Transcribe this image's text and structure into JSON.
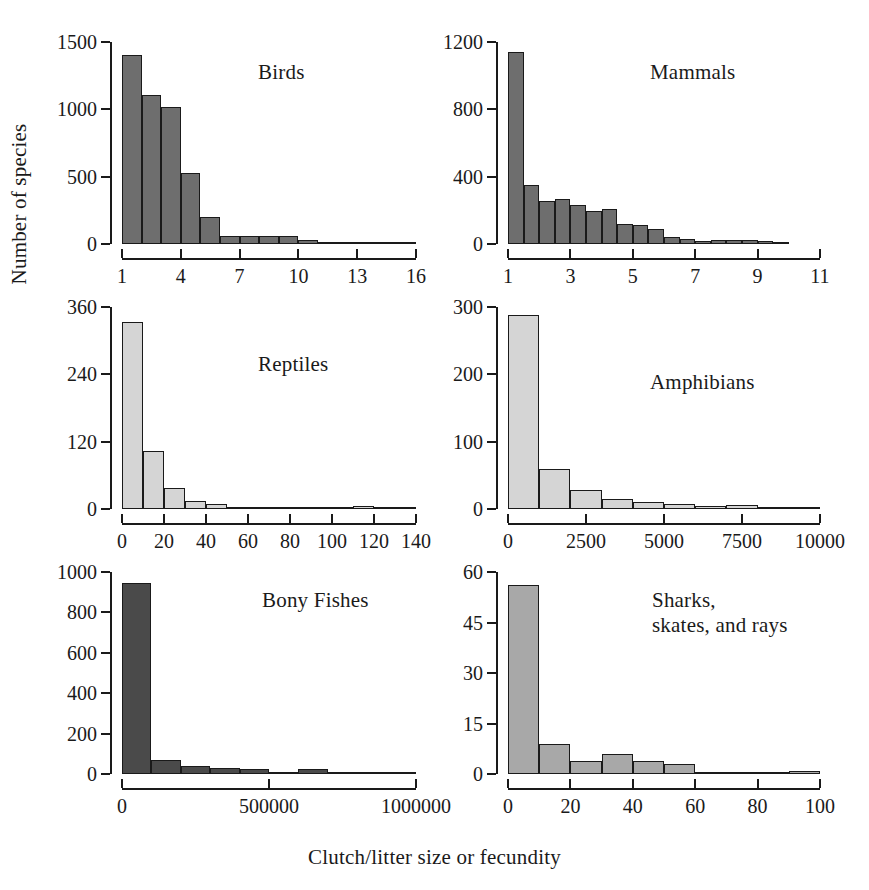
{
  "figure": {
    "xlabel": "Clutch/litter size or fecundity",
    "ylabel": "Number of species"
  },
  "chart_data": [
    {
      "type": "bar",
      "title": "Birds",
      "xlabel": "",
      "ylabel": "Number of species",
      "fill_color": "#6e6e6e",
      "edge_color": "#1a1a1a",
      "grid": false,
      "legend": "none",
      "xlim": [
        1,
        16
      ],
      "ylim": [
        0,
        1500
      ],
      "yticks": [
        0,
        500,
        1000,
        1500
      ],
      "ytick_labels": [
        "0",
        "500",
        "1000",
        "1500"
      ],
      "xticks": [
        1,
        4,
        7,
        10,
        13,
        16
      ],
      "xtick_labels": [
        "1",
        "4",
        "7",
        "10",
        "13",
        "16"
      ],
      "bin_edges": [
        1,
        2,
        3,
        4,
        5,
        6,
        7,
        8,
        9,
        10,
        11,
        12,
        13,
        14,
        15,
        16
      ],
      "values": [
        1400,
        1105,
        1015,
        525,
        200,
        57,
        57,
        62,
        57,
        33,
        12,
        4,
        2,
        1,
        0
      ]
    },
    {
      "type": "bar",
      "title": "Mammals",
      "xlabel": "",
      "ylabel": "Number of species",
      "fill_color": "#6e6e6e",
      "edge_color": "#1a1a1a",
      "grid": false,
      "legend": "none",
      "xlim": [
        1,
        11
      ],
      "ylim": [
        0,
        1200
      ],
      "yticks": [
        0,
        400,
        800,
        1200
      ],
      "ytick_labels": [
        "0",
        "400",
        "800",
        "1200"
      ],
      "xticks": [
        1,
        3,
        5,
        7,
        9,
        11
      ],
      "xtick_labels": [
        "1",
        "3",
        "5",
        "7",
        "9",
        "11"
      ],
      "bin_edges": [
        1,
        1.5,
        2,
        2.5,
        3,
        3.5,
        4,
        4.5,
        5,
        5.5,
        6,
        6.5,
        7,
        7.5,
        8,
        8.5,
        9,
        9.5,
        10
      ],
      "values": [
        1140,
        348,
        255,
        270,
        232,
        195,
        208,
        120,
        113,
        92,
        44,
        30,
        18,
        25,
        22,
        22,
        20,
        4
      ]
    },
    {
      "type": "bar",
      "title": "Reptiles",
      "xlabel": "",
      "ylabel": "Number of species",
      "fill_color": "#d5d5d5",
      "edge_color": "#1a1a1a",
      "grid": false,
      "legend": "none",
      "xlim": [
        0,
        140
      ],
      "ylim": [
        0,
        360
      ],
      "yticks": [
        0,
        120,
        240,
        360
      ],
      "ytick_labels": [
        "0",
        "120",
        "240",
        "360"
      ],
      "xticks": [
        0,
        20,
        40,
        60,
        80,
        100,
        120,
        140
      ],
      "xtick_labels": [
        "0",
        "20",
        "40",
        "60",
        "80",
        "100",
        "120",
        "140"
      ],
      "bin_edges": [
        0,
        10,
        20,
        30,
        40,
        50,
        60,
        70,
        80,
        90,
        100,
        110,
        120,
        130,
        140
      ],
      "values": [
        333,
        103,
        38,
        15,
        9,
        3,
        1,
        1,
        2,
        2,
        1,
        6,
        1,
        1
      ]
    },
    {
      "type": "bar",
      "title": "Amphibians",
      "xlabel": "",
      "ylabel": "Number of species",
      "fill_color": "#d5d5d5",
      "edge_color": "#1a1a1a",
      "grid": false,
      "legend": "none",
      "xlim": [
        0,
        10000
      ],
      "ylim": [
        0,
        300
      ],
      "yticks": [
        0,
        100,
        200,
        300
      ],
      "ytick_labels": [
        "0",
        "100",
        "200",
        "300"
      ],
      "xticks": [
        0,
        2500,
        5000,
        7500,
        10000
      ],
      "xtick_labels": [
        "0",
        "2500",
        "5000",
        "7500",
        "10000"
      ],
      "bin_edges": [
        0,
        1000,
        2000,
        3000,
        4000,
        5000,
        6000,
        7000,
        8000,
        9000,
        10000
      ],
      "values": [
        288,
        60,
        28,
        15,
        11,
        7,
        4,
        6,
        1,
        3
      ]
    },
    {
      "type": "bar",
      "title": "Bony Fishes",
      "xlabel": "",
      "ylabel": "Number of species",
      "fill_color": "#4a4a4a",
      "edge_color": "#1a1a1a",
      "grid": false,
      "legend": "none",
      "xlim": [
        0,
        1000000
      ],
      "ylim": [
        0,
        1000
      ],
      "yticks": [
        0,
        200,
        400,
        600,
        800,
        1000
      ],
      "ytick_labels": [
        "0",
        "200",
        "400",
        "600",
        "800",
        "1000"
      ],
      "xticks": [
        0,
        500000,
        1000000
      ],
      "xtick_labels": [
        "0",
        "500000",
        "1000000"
      ],
      "bin_edges": [
        0,
        100000,
        200000,
        300000,
        400000,
        500000,
        600000,
        700000,
        800000,
        900000,
        1000000
      ],
      "values": [
        948,
        70,
        40,
        28,
        25,
        10,
        25,
        9,
        7,
        6
      ]
    },
    {
      "type": "bar",
      "title": "Sharks,\nskates, and rays",
      "xlabel": "",
      "ylabel": "Number of species",
      "fill_color": "#a8a8a8",
      "edge_color": "#1a1a1a",
      "grid": false,
      "legend": "none",
      "xlim": [
        0,
        100
      ],
      "ylim": [
        0,
        60
      ],
      "yticks": [
        0,
        15,
        30,
        45,
        60
      ],
      "ytick_labels": [
        "0",
        "15",
        "30",
        "45",
        "60"
      ],
      "xticks": [
        0,
        20,
        40,
        60,
        80,
        100
      ],
      "xtick_labels": [
        "0",
        "20",
        "40",
        "60",
        "80",
        "100"
      ],
      "bin_edges": [
        0,
        10,
        20,
        30,
        40,
        50,
        60,
        70,
        80,
        90,
        100
      ],
      "values": [
        56,
        9,
        4,
        6,
        4,
        3,
        0,
        0,
        0,
        1
      ]
    }
  ],
  "panel_layout": [
    {
      "index": 0,
      "plot_left": 122,
      "plot_top": 42,
      "plot_width": 294,
      "plot_height": 202,
      "title_left": 258,
      "title_top": 60
    },
    {
      "index": 1,
      "plot_left": 508,
      "plot_top": 42,
      "plot_width": 312,
      "plot_height": 202,
      "title_left": 650,
      "title_top": 60
    },
    {
      "index": 2,
      "plot_left": 122,
      "plot_top": 307,
      "plot_width": 294,
      "plot_height": 202,
      "title_left": 258,
      "title_top": 352
    },
    {
      "index": 3,
      "plot_left": 508,
      "plot_top": 307,
      "plot_width": 312,
      "plot_height": 202,
      "title_left": 650,
      "title_top": 370
    },
    {
      "index": 4,
      "plot_left": 122,
      "plot_top": 572,
      "plot_width": 294,
      "plot_height": 202,
      "title_left": 262,
      "title_top": 588
    },
    {
      "index": 5,
      "plot_left": 508,
      "plot_top": 572,
      "plot_width": 312,
      "plot_height": 202,
      "title_left": 652,
      "title_top": 588
    }
  ]
}
